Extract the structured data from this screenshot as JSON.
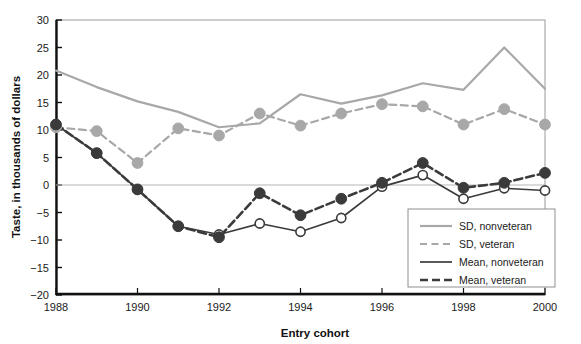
{
  "chart_data": {
    "type": "line",
    "title": "",
    "xlabel": "Entry cohort",
    "ylabel": "Taste, in thousands of dollars",
    "x": [
      1988,
      1989,
      1990,
      1991,
      1992,
      1993,
      1994,
      1995,
      1996,
      1997,
      1998,
      1999,
      2000
    ],
    "xlim": [
      1988,
      2000
    ],
    "ylim": [
      -20,
      30
    ],
    "xticks": [
      1988,
      1990,
      1992,
      1994,
      1996,
      1998,
      2000
    ],
    "xtick_labels": [
      "1988",
      "1990",
      "1992",
      "1994",
      "1996",
      "1998",
      "2000"
    ],
    "yticks": [
      -20,
      -15,
      -10,
      -5,
      0,
      5,
      10,
      15,
      20,
      25,
      30
    ],
    "ytick_labels": [
      "−20",
      "−15",
      "−10",
      "−5",
      "0",
      "5",
      "10",
      "15",
      "20",
      "25",
      "30"
    ],
    "grid": false,
    "zero_line": true,
    "legend_position": "bottom-right",
    "series": [
      {
        "name": "SD, nonveteran",
        "style": "solid",
        "color": "#a8a8a8",
        "width": 2.2,
        "markers": false,
        "values": [
          20.8,
          17.8,
          15.2,
          13.3,
          10.5,
          11.2,
          16.5,
          14.8,
          16.3,
          18.5,
          17.3,
          25.0,
          17.5
        ]
      },
      {
        "name": "SD, veteran",
        "style": "dashed",
        "color": "#a8a8a8",
        "width": 2.2,
        "markers": true,
        "marker_style": "filled",
        "marker_color": "#a8a8a8",
        "values": [
          10.5,
          9.8,
          4.0,
          10.3,
          9.0,
          13.0,
          10.8,
          13.0,
          14.7,
          14.3,
          11.0,
          13.8,
          11.0
        ]
      },
      {
        "name": "Mean, nonveteran",
        "style": "solid",
        "color": "#3b3b3b",
        "width": 1.7,
        "markers": true,
        "marker_style": "open",
        "marker_color": "#ffffff",
        "values": [
          11.0,
          5.8,
          -0.8,
          -7.5,
          -9.0,
          -7.0,
          -8.5,
          -6.0,
          -0.3,
          1.8,
          -2.5,
          -0.6,
          -1.0
        ]
      },
      {
        "name": "Mean, veteran",
        "style": "dashed",
        "color": "#3b3b3b",
        "width": 2.6,
        "markers": true,
        "marker_style": "filled",
        "marker_color": "#3b3b3b",
        "values": [
          11.0,
          5.8,
          -0.8,
          -7.5,
          -9.5,
          -1.5,
          -5.5,
          -2.5,
          0.4,
          4.0,
          -0.5,
          0.4,
          2.2
        ]
      }
    ]
  },
  "legend": {
    "items": [
      {
        "label": "SD, nonveteran"
      },
      {
        "label": "SD, veteran"
      },
      {
        "label": "Mean, nonveteran"
      },
      {
        "label": "Mean, veteran"
      }
    ]
  }
}
